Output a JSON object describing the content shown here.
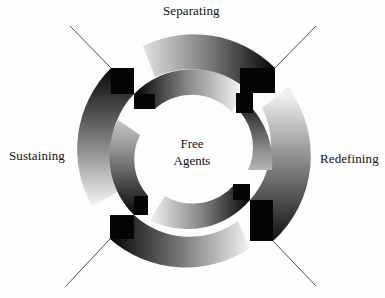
{
  "diagram": {
    "center_label_line1": "Free",
    "center_label_line2": "Agents",
    "stages": [
      {
        "label": "Separating",
        "position": "top"
      },
      {
        "label": "Redefining",
        "position": "right"
      },
      {
        "label": "Sustaining",
        "position": "left"
      }
    ]
  }
}
